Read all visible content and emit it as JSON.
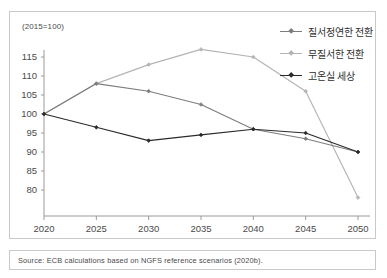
{
  "unit_note": "(2015=100)",
  "source": "Source: ECB calculations based on NGFS reference scenarios (2020b).",
  "legend": {
    "items": [
      {
        "label": "질서정연한 전환",
        "color": "#7d7d7d"
      },
      {
        "label": "무질서한 전환",
        "color": "#b4b4b4"
      },
      {
        "label": "고온실 세상",
        "color": "#2b2b2b"
      }
    ]
  },
  "chart_data": {
    "type": "line",
    "title": "",
    "subtitle": "",
    "xlabel": "",
    "ylabel": "(2015=100)",
    "x": [
      2020,
      2025,
      2030,
      2035,
      2040,
      2045,
      2050
    ],
    "xtick_labels": [
      "2020",
      "2025",
      "2030",
      "2035",
      "2040",
      "2045",
      "2050"
    ],
    "ytick_labels": [
      "115",
      "110",
      "105",
      "100",
      "95",
      "90",
      "85",
      "80"
    ],
    "yticks": [
      115,
      110,
      105,
      100,
      95,
      90,
      85,
      80
    ],
    "ylim": [
      77,
      118
    ],
    "xlim": [
      2019,
      2051
    ],
    "grid": false,
    "legend_position": "top-right",
    "series": [
      {
        "name": "질서정연한 전환",
        "color": "#7d7d7d",
        "values": [
          100,
          108,
          106,
          102.5,
          96,
          93.5,
          90
        ]
      },
      {
        "name": "무질서한 전환",
        "color": "#b4b4b4",
        "values": [
          100,
          108,
          113,
          117,
          115,
          106,
          78
        ]
      },
      {
        "name": "고온실 세상",
        "color": "#2b2b2b",
        "values": [
          100,
          96.5,
          93,
          94.5,
          96,
          95,
          90
        ]
      }
    ]
  }
}
